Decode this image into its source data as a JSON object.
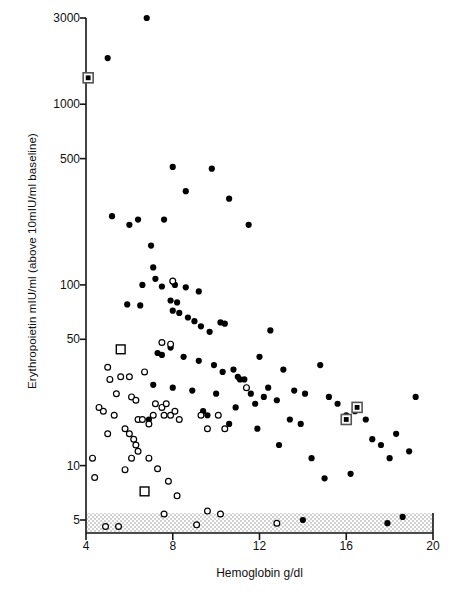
{
  "figure": {
    "title": "",
    "xlabel": "Hemoglobin g/dl",
    "ylabel": "Erythropoietin mIU/ml (above 10mIU/ml baseline)"
  },
  "chart_data": {
    "type": "scatter",
    "title": "",
    "xlabel": "Hemoglobin g/dl",
    "ylabel": "Erythropoietin mIU/ml (above 10mIU/ml baseline)",
    "xlim": [
      4,
      20
    ],
    "ylim": [
      5,
      3000
    ],
    "yscale": "log",
    "xscale": "linear",
    "grid": false,
    "legend": null,
    "xticks": [
      4,
      8,
      12,
      16,
      20
    ],
    "xticklabels": [
      "4",
      "8",
      "12",
      "16",
      "20"
    ],
    "yticks": [
      5,
      10,
      50,
      100,
      500,
      1000,
      3000
    ],
    "yticklabels": [
      "5",
      "10",
      "50",
      "100",
      "500",
      "1000",
      "3000"
    ],
    "annotations": [
      {
        "name": "below-detection-band",
        "kind": "stippled-band",
        "description": "Stippled (dotted shading) band spanning the full x range below the 5 mIU/ml level, indicating values at or under the assay baseline",
        "x_range": [
          4,
          20
        ],
        "y_range": [
          3.6,
          5.0
        ]
      }
    ],
    "series": [
      {
        "name": "filled-circle",
        "marker": "filled-circle",
        "color": "#000000",
        "points": [
          [
            6.8,
            3000
          ],
          [
            5.0,
            1800
          ],
          [
            8.0,
            450
          ],
          [
            8.6,
            330
          ],
          [
            6.4,
            230
          ],
          [
            7.0,
            165
          ],
          [
            9.8,
            440
          ],
          [
            10.6,
            300
          ],
          [
            5.2,
            240
          ],
          [
            6.0,
            215
          ],
          [
            7.1,
            125
          ],
          [
            7.6,
            230
          ],
          [
            11.5,
            215
          ],
          [
            7.2,
            108
          ],
          [
            6.6,
            100
          ],
          [
            7.5,
            98
          ],
          [
            8.0,
            104
          ],
          [
            8.1,
            100
          ],
          [
            8.6,
            97
          ],
          [
            9.2,
            92
          ],
          [
            5.9,
            78
          ],
          [
            6.5,
            77
          ],
          [
            7.9,
            82
          ],
          [
            8.2,
            80
          ],
          [
            8.0,
            72
          ],
          [
            8.3,
            70
          ],
          [
            8.7,
            66
          ],
          [
            9.0,
            63
          ],
          [
            9.3,
            59
          ],
          [
            9.7,
            55
          ],
          [
            10.2,
            62
          ],
          [
            10.4,
            61
          ],
          [
            12.5,
            56
          ],
          [
            7.3,
            42
          ],
          [
            7.5,
            41
          ],
          [
            7.9,
            45
          ],
          [
            8.5,
            40
          ],
          [
            9.2,
            38
          ],
          [
            9.9,
            36
          ],
          [
            12.0,
            40
          ],
          [
            7.1,
            28
          ],
          [
            8.0,
            27
          ],
          [
            8.9,
            26
          ],
          [
            10.0,
            25
          ],
          [
            6.9,
            18
          ],
          [
            11.0,
            31
          ],
          [
            11.1,
            30
          ],
          [
            11.3,
            30
          ],
          [
            11.6,
            25
          ],
          [
            12.2,
            24
          ],
          [
            12.8,
            23
          ],
          [
            10.9,
            21
          ],
          [
            11.8,
            22
          ],
          [
            12.4,
            27
          ],
          [
            13.1,
            34
          ],
          [
            13.6,
            26
          ],
          [
            14.1,
            25
          ],
          [
            14.8,
            36
          ],
          [
            15.2,
            24
          ],
          [
            15.6,
            22
          ],
          [
            16.0,
            19
          ],
          [
            16.4,
            20
          ],
          [
            16.9,
            18
          ],
          [
            17.2,
            14
          ],
          [
            17.6,
            13
          ],
          [
            18.3,
            15
          ],
          [
            18.0,
            11
          ],
          [
            18.9,
            12
          ],
          [
            19.2,
            24
          ],
          [
            13.4,
            18
          ],
          [
            13.9,
            17
          ],
          [
            10.6,
            17
          ],
          [
            14.4,
            11
          ],
          [
            15.0,
            8.5
          ],
          [
            16.2,
            9.0
          ],
          [
            12.9,
            13
          ],
          [
            14.0,
            5.0
          ],
          [
            17.9,
            4.8
          ],
          [
            18.6,
            5.2
          ],
          [
            9.4,
            20
          ],
          [
            9.6,
            19
          ],
          [
            10.3,
            33
          ],
          [
            10.8,
            34
          ],
          [
            11.9,
            16
          ]
        ]
      },
      {
        "name": "open-circle",
        "marker": "open-circle",
        "color": "#000000",
        "points": [
          [
            8.0,
            105
          ],
          [
            7.5,
            48
          ],
          [
            7.9,
            47
          ],
          [
            5.0,
            35
          ],
          [
            5.6,
            31
          ],
          [
            6.0,
            31
          ],
          [
            5.4,
            25
          ],
          [
            6.1,
            24
          ],
          [
            6.3,
            23
          ],
          [
            4.6,
            21
          ],
          [
            4.8,
            20
          ],
          [
            5.3,
            19
          ],
          [
            6.4,
            18
          ],
          [
            6.6,
            18
          ],
          [
            6.9,
            17
          ],
          [
            7.2,
            22
          ],
          [
            7.5,
            21
          ],
          [
            7.7,
            22
          ],
          [
            7.1,
            19
          ],
          [
            7.6,
            19
          ],
          [
            7.9,
            19
          ],
          [
            8.1,
            20
          ],
          [
            8.3,
            18
          ],
          [
            9.3,
            19
          ],
          [
            10.1,
            19
          ],
          [
            9.6,
            16
          ],
          [
            10.4,
            16
          ],
          [
            5.0,
            15
          ],
          [
            5.8,
            16
          ],
          [
            6.0,
            15
          ],
          [
            6.2,
            14
          ],
          [
            6.3,
            13
          ],
          [
            6.4,
            12
          ],
          [
            6.1,
            11
          ],
          [
            4.3,
            11
          ],
          [
            6.9,
            11
          ],
          [
            5.8,
            9.5
          ],
          [
            7.3,
            9.6
          ],
          [
            7.8,
            8.2
          ],
          [
            4.4,
            8.6
          ],
          [
            8.2,
            6.8
          ],
          [
            7.6,
            5.4
          ],
          [
            9.6,
            5.6
          ],
          [
            10.2,
            5.4
          ],
          [
            4.9,
            4.6
          ],
          [
            5.5,
            4.6
          ],
          [
            9.1,
            4.7
          ],
          [
            12.8,
            4.8
          ],
          [
            11.4,
            27
          ],
          [
            5.1,
            30
          ],
          [
            6.7,
            33
          ]
        ]
      },
      {
        "name": "filled-square",
        "marker": "filled-square-outlined",
        "color": "#000000",
        "points": [
          [
            4.1,
            1400
          ],
          [
            16.0,
            18
          ],
          [
            16.5,
            21
          ]
        ]
      },
      {
        "name": "open-square",
        "marker": "open-square",
        "color": "#000000",
        "points": [
          [
            5.6,
            44
          ],
          [
            6.7,
            7.2
          ]
        ]
      }
    ]
  }
}
